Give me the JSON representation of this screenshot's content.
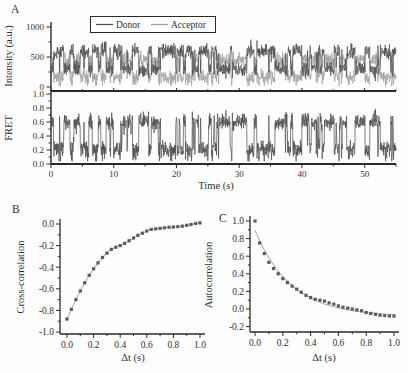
{
  "figure": {
    "background": "#fefefe",
    "panels": {
      "a": "A",
      "b": "B",
      "c": "C"
    }
  },
  "colors": {
    "background": "#fefefe",
    "axis": "#2a2a2a",
    "text": "#2f2f2f",
    "donor": "#4f4f4f",
    "acceptor": "#a0a0a0",
    "fret_trace": "#4c4c4c",
    "marker": "#5c5c5c",
    "fit_line": "#b3b3b3"
  },
  "chart_data": [
    {
      "id": "intensity",
      "type": "line",
      "panel": "A",
      "ylabel": "Intensity (a.u.)",
      "xlim": [
        0,
        55
      ],
      "ylim": [
        0,
        1000
      ],
      "yticks": [
        {
          "v": 0,
          "label": "0"
        },
        {
          "v": 500,
          "label": "500"
        },
        {
          "v": 1000,
          "label": "1000"
        }
      ],
      "yminor": [
        250,
        750
      ],
      "legend": [
        {
          "name": "Donor"
        },
        {
          "name": "Acceptor"
        }
      ],
      "legend_position": "top-inside",
      "series_generator": {
        "kind": "two_state_telegraph_smFRET",
        "seed": 11,
        "duration_s": 55,
        "sample_dt_s": 0.04,
        "mean_dwell_s": 0.5,
        "min_dwell_s": 0.08,
        "states": {
          "low_fret": {
            "fret": 0.2,
            "donor": 600,
            "acceptor": 155
          },
          "high_fret": {
            "fret": 0.6,
            "donor": 305,
            "acceptor": 450
          }
        },
        "intensity_noise_sigma": 62
      }
    },
    {
      "id": "fret",
      "type": "line",
      "panel": "A",
      "ylabel": "FRET",
      "xlabel": "Time (s)",
      "xlim": [
        0,
        55
      ],
      "ylim": [
        0,
        1
      ],
      "derived_from": "intensity",
      "levels": [
        0.2,
        0.6
      ],
      "yticks": [
        {
          "v": 0.0,
          "label": "0.0"
        },
        {
          "v": 0.2,
          "label": "0.2"
        },
        {
          "v": 0.4,
          "label": "0.4"
        },
        {
          "v": 0.6,
          "label": "0.6"
        },
        {
          "v": 0.8,
          "label": "0.8"
        },
        {
          "v": 1.0,
          "label": "1.0"
        }
      ],
      "yminor": [
        0.1,
        0.3,
        0.5,
        0.7,
        0.9
      ],
      "xticks": [
        {
          "v": 0,
          "label": "0"
        },
        {
          "v": 10,
          "label": "10"
        },
        {
          "v": 20,
          "label": "20"
        },
        {
          "v": 30,
          "label": "30"
        },
        {
          "v": 40,
          "label": "40"
        },
        {
          "v": 50,
          "label": "50"
        }
      ],
      "xminor": [
        5,
        15,
        25,
        35,
        45,
        55
      ]
    },
    {
      "id": "cross_correlation",
      "type": "scatter",
      "panel": "B",
      "ylabel": "Cross-correlation",
      "xlabel": "Δt (s)",
      "xlim": [
        0,
        1
      ],
      "ylim": [
        -1.0,
        0.05
      ],
      "grid": false,
      "xticks": [
        {
          "v": 0.0,
          "label": "0.0"
        },
        {
          "v": 0.2,
          "label": "0.2"
        },
        {
          "v": 0.4,
          "label": "0.4"
        },
        {
          "v": 0.6,
          "label": "0.6"
        },
        {
          "v": 0.8,
          "label": "0.8"
        },
        {
          "v": 1.0,
          "label": "1.0"
        }
      ],
      "xminor": [
        0.1,
        0.3,
        0.5,
        0.7,
        0.9
      ],
      "yticks": [
        {
          "v": 0.0,
          "label": "0.0"
        },
        {
          "v": -0.2,
          "label": "-0.2"
        },
        {
          "v": -0.4,
          "label": "-0.4"
        },
        {
          "v": -0.6,
          "label": "-0.6"
        },
        {
          "v": -0.8,
          "label": "-0.8"
        },
        {
          "v": -1.0,
          "label": "-1.0"
        }
      ],
      "yminor": [
        -0.1,
        -0.3,
        -0.5,
        -0.7,
        -0.9
      ],
      "x": [
        0.0,
        0.033,
        0.067,
        0.1,
        0.133,
        0.167,
        0.2,
        0.233,
        0.267,
        0.3,
        0.333,
        0.367,
        0.4,
        0.433,
        0.467,
        0.5,
        0.533,
        0.567,
        0.6,
        0.633,
        0.667,
        0.7,
        0.733,
        0.767,
        0.8,
        0.833,
        0.867,
        0.9,
        0.933,
        0.967,
        1.0
      ],
      "y": [
        -0.88,
        -0.79,
        -0.7,
        -0.62,
        -0.545,
        -0.475,
        -0.415,
        -0.36,
        -0.31,
        -0.27,
        -0.235,
        -0.215,
        -0.2,
        -0.18,
        -0.155,
        -0.13,
        -0.105,
        -0.085,
        -0.065,
        -0.05,
        -0.045,
        -0.04,
        -0.035,
        -0.03,
        -0.028,
        -0.025,
        -0.02,
        -0.012,
        -0.005,
        0.005,
        0.01
      ],
      "fit": {
        "model": "through_data"
      }
    },
    {
      "id": "autocorrelation",
      "type": "scatter",
      "panel": "C",
      "ylabel": "Autocorrelation",
      "xlabel": "Δt (s)",
      "xlim": [
        0,
        1
      ],
      "ylim": [
        -0.2,
        1.0
      ],
      "grid": false,
      "xticks": [
        {
          "v": 0.0,
          "label": "0.0"
        },
        {
          "v": 0.2,
          "label": "0.2"
        },
        {
          "v": 0.4,
          "label": "0.4"
        },
        {
          "v": 0.6,
          "label": "0.6"
        },
        {
          "v": 0.8,
          "label": "0.8"
        },
        {
          "v": 1.0,
          "label": "1.0"
        }
      ],
      "xminor": [
        0.1,
        0.3,
        0.5,
        0.7,
        0.9
      ],
      "yticks": [
        {
          "v": -0.2,
          "label": "-0.2"
        },
        {
          "v": 0.0,
          "label": "0.0"
        },
        {
          "v": 0.2,
          "label": "0.2"
        },
        {
          "v": 0.4,
          "label": "0.4"
        },
        {
          "v": 0.6,
          "label": "0.6"
        },
        {
          "v": 0.8,
          "label": "0.8"
        },
        {
          "v": 1.0,
          "label": "1.0"
        }
      ],
      "yminor": [
        -0.1,
        0.1,
        0.3,
        0.5,
        0.7,
        0.9
      ],
      "x": [
        0.0,
        0.033,
        0.067,
        0.1,
        0.133,
        0.167,
        0.2,
        0.233,
        0.267,
        0.3,
        0.333,
        0.367,
        0.4,
        0.433,
        0.467,
        0.5,
        0.533,
        0.567,
        0.6,
        0.633,
        0.667,
        0.7,
        0.733,
        0.767,
        0.8,
        0.833,
        0.867,
        0.9,
        0.933,
        0.967,
        1.0
      ],
      "y": [
        1.0,
        0.75,
        0.63,
        0.53,
        0.46,
        0.4,
        0.345,
        0.3,
        0.26,
        0.225,
        0.19,
        0.155,
        0.13,
        0.11,
        0.1,
        0.09,
        0.07,
        0.055,
        0.035,
        0.02,
        0.01,
        0.0,
        -0.01,
        -0.02,
        -0.04,
        -0.05,
        -0.06,
        -0.07,
        -0.075,
        -0.08,
        -0.08
      ],
      "fit": {
        "model": "exponential_decay",
        "amplitude": 0.98,
        "tau_s": 0.26,
        "offset": -0.085
      }
    }
  ]
}
